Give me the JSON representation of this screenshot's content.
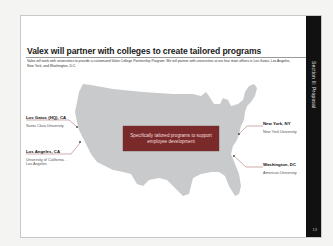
{
  "slide": {
    "title": "Valex will partner with colleges to create tailored programs",
    "intro": "Valex will work with universities to provide a customized Valex College Partnership Program. We will partner with universities at our four main offices in Los Gatos, Los Angeles, New York, and Washington, D.C.",
    "section_label": "Section II: Proposal",
    "page_number": "13",
    "callout": "Specifically tailored programs to support employee development",
    "locations": [
      {
        "city": "Los Gatos (HQ), CA",
        "university": "Santa Clara University"
      },
      {
        "city": "Los Angeles, CA",
        "university": "University of California - Los Angeles"
      },
      {
        "city": "New York, NY",
        "university": "New York University"
      },
      {
        "city": "Washington, DC",
        "university": "American University"
      }
    ],
    "colors": {
      "callout_bg": "#7a2a2a",
      "map_fill": "#c9cacb",
      "side_bar": "#111111",
      "leader_line": "#b88a8a"
    }
  }
}
